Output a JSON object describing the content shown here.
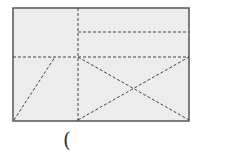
{
  "diagram": {
    "type": "rectangle-dissection",
    "fill_color": "#ececec",
    "border_color": "#555555",
    "dash_color": "#444444",
    "rect": {
      "x": 13,
      "y": 8,
      "w": 176,
      "h": 113
    },
    "dashed_lines": [
      {
        "name": "vertical-divider",
        "x1": 78,
        "y1": 8,
        "x2": 78,
        "y2": 121
      },
      {
        "name": "upper-right-horizontal",
        "x1": 78,
        "y1": 32,
        "x2": 189,
        "y2": 32
      },
      {
        "name": "middle-horizontal",
        "x1": 13,
        "y1": 57,
        "x2": 189,
        "y2": 57
      },
      {
        "name": "left-diagonal",
        "x1": 14,
        "y1": 120,
        "x2": 55,
        "y2": 57
      },
      {
        "name": "x-diagonal-down",
        "x1": 78,
        "y1": 57,
        "x2": 189,
        "y2": 120
      },
      {
        "name": "x-diagonal-up",
        "x1": 78,
        "y1": 120,
        "x2": 189,
        "y2": 57
      }
    ]
  },
  "caption": {
    "text": "("
  }
}
